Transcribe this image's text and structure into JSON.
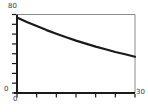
{
  "chart_data": {
    "type": "line",
    "title": "",
    "xlabel": "",
    "ylabel": "",
    "xlim": [
      0,
      30
    ],
    "ylim": [
      0,
      80
    ],
    "x_tick_step": 5,
    "y_tick_step": 10,
    "grid": false,
    "legend": false,
    "x": [
      0,
      2.5,
      5,
      7.5,
      10,
      12.5,
      15,
      17.5,
      20,
      22.5,
      25,
      27.5,
      30
    ],
    "series": [
      {
        "name": "decay-curve",
        "values": [
          77.0,
          72.4,
          68.2,
          64.1,
          60.4,
          56.8,
          53.4,
          50.3,
          47.3,
          44.5,
          41.8,
          39.4,
          37.0
        ]
      }
    ]
  },
  "labels": {
    "y_max": "80",
    "y_min": "0",
    "x_min": "0",
    "x_max": "30"
  },
  "colors": {
    "background": "#ffffff",
    "axis": "#1a1a1a",
    "frame": "#8c8c8c",
    "curve": "#1a1a1a",
    "label": "#3a3a3a"
  }
}
